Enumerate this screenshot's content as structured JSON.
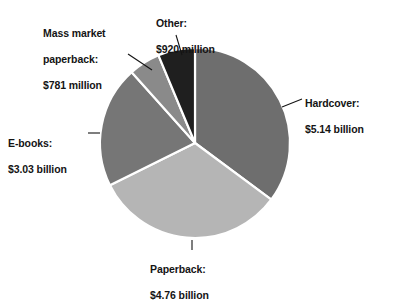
{
  "chart_data": {
    "type": "pie",
    "title": "",
    "subtitle": "",
    "unit": "USD",
    "categories": [
      "Hardcover",
      "Paperback",
      "E-books",
      "Mass market paperback",
      "Other"
    ],
    "values": [
      5140,
      4760,
      3030,
      781,
      920
    ],
    "value_unit": "million USD",
    "value_labels": [
      "$5.14 billion",
      "$4.76 billion",
      "$3.03 billion",
      "$781 million",
      "$920 million"
    ],
    "percentages": [
      35.1,
      32.5,
      20.7,
      5.3,
      6.3
    ],
    "colors": [
      "#6e6e6e",
      "#b5b5b5",
      "#767676",
      "#8a8a8a",
      "#1f1f1f"
    ],
    "separator_color": "#ffffff",
    "start_angle_deg": 0,
    "direction": "clockwise",
    "legend": "callout-labels",
    "grid": false,
    "slices": [
      {
        "name": "Hardcover",
        "label_line_1": "Hardcover:",
        "label_line_2": "$5.14 billion",
        "value_million": 5140,
        "percent": 35.1,
        "color": "#6e6e6e",
        "start_deg": 0,
        "end_deg": 126.5
      },
      {
        "name": "Paperback",
        "label_line_1": "Paperback:",
        "label_line_2": "$4.76 billion",
        "value_million": 4760,
        "percent": 32.5,
        "color": "#b5b5b5",
        "start_deg": 126.5,
        "end_deg": 243.6
      },
      {
        "name": "E-books",
        "label_line_1": "E-books:",
        "label_line_2": "$3.03 billion",
        "value_million": 3030,
        "percent": 20.7,
        "color": "#767676",
        "start_deg": 243.6,
        "end_deg": 318.2
      },
      {
        "name": "Mass market paperback",
        "label_line_1": "Mass market",
        "label_line_2": "paperback:",
        "label_line_3": "$781 million",
        "value_million": 781,
        "percent": 5.3,
        "color": "#8a8a8a",
        "start_deg": 318.2,
        "end_deg": 337.4
      },
      {
        "name": "Other",
        "label_line_1": "Other:",
        "label_line_2": "$920 million",
        "value_million": 920,
        "percent": 6.3,
        "color": "#1f1f1f",
        "start_deg": 337.4,
        "end_deg": 360
      }
    ],
    "geometry": {
      "center_x": 195,
      "center_y": 143,
      "radius": 95
    }
  }
}
